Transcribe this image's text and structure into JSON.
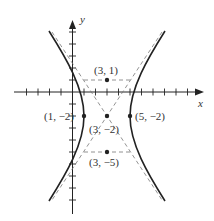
{
  "figure": {
    "type": "hyperbola-graph",
    "axes": {
      "x_label": "x",
      "y_label": "y"
    },
    "equation_center": [
      3,
      -2
    ],
    "points": [
      {
        "label": "(3, 1)",
        "x": 3,
        "y": 1,
        "role": "vertex"
      },
      {
        "label": "(1, −2)",
        "x": 1,
        "y": -2,
        "role": "co-vertex"
      },
      {
        "label": "(3, −2)",
        "x": 3,
        "y": -2,
        "role": "center"
      },
      {
        "label": "(5, −2)",
        "x": 5,
        "y": -2,
        "role": "co-vertex"
      },
      {
        "label": "(3, −5)",
        "x": 3,
        "y": -5,
        "role": "vertex"
      }
    ],
    "line_color": "#222222",
    "dash_color": "#777777"
  }
}
